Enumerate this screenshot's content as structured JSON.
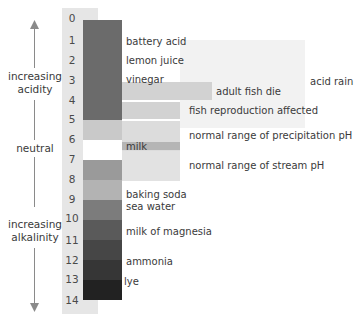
{
  "scale": {
    "numbers": [
      "0",
      "1",
      "2",
      "3",
      "4",
      "5",
      "6",
      "7",
      "8",
      "9",
      "10",
      "11",
      "12",
      "13",
      "14"
    ],
    "bands": [
      {
        "from": 0,
        "to": 5,
        "color": "#6b6b6b"
      },
      {
        "from": 5,
        "to": 6,
        "color": "#c9c9c9"
      },
      {
        "from": 6,
        "to": 7,
        "color": "#ffffff"
      },
      {
        "from": 7,
        "to": 8,
        "color": "#9a9a9a"
      },
      {
        "from": 8,
        "to": 9,
        "color": "#b8b8b8"
      },
      {
        "from": 9,
        "to": 10,
        "color": "#7c7c7c"
      },
      {
        "from": 10,
        "to": 11,
        "color": "#5a5a5a"
      },
      {
        "from": 11,
        "to": 12,
        "color": "#464646"
      },
      {
        "from": 12,
        "to": 13,
        "color": "#363636"
      },
      {
        "from": 13,
        "to": 14,
        "color": "#222222"
      }
    ]
  },
  "axis": {
    "top_label": "increasing acidity",
    "middle_label": "neutral",
    "bottom_label": "increasing alkalinity"
  },
  "substances": [
    {
      "label": "battery acid",
      "ph": 1
    },
    {
      "label": "lemon juice",
      "ph": 2
    },
    {
      "label": "vinegar",
      "ph": 3
    },
    {
      "label": "milk",
      "ph": 6.5
    },
    {
      "label": "baking soda",
      "ph": 8.8
    },
    {
      "label": "sea water",
      "ph": 9.3
    },
    {
      "label": "milk of magnesia",
      "ph": 10.5
    },
    {
      "label": "ammonia",
      "ph": 12
    },
    {
      "label": "lye",
      "ph": 13
    }
  ],
  "ranges": [
    {
      "label": "acid rain",
      "from": 0.5,
      "to": 5.6
    },
    {
      "label": "adult fish die",
      "from": 3.2,
      "to": 4.1
    },
    {
      "label": "fish reproduction affected",
      "from": 4.1,
      "to": 5.1
    },
    {
      "label": "normal range of precipitation pH",
      "from": 5.1,
      "to": 6.6
    },
    {
      "label": "normal range of stream pH",
      "from": 6.6,
      "to": 8.1
    }
  ],
  "colors": {
    "number_column_bg": "#e6e6e6",
    "acid_rain_bg": "#f2f2f2",
    "range_bar": "#d2d2d2",
    "milk_bar": "#b5b5b5",
    "text": "#3a3a3a"
  }
}
